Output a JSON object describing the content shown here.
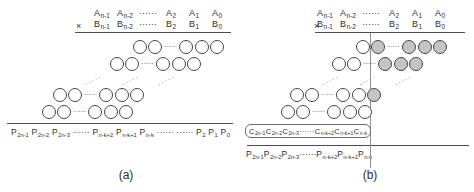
{
  "glyphs": {
    "times": "×",
    "inline_dots": "······",
    "row_dots": "·····",
    "diag_dots": "·····"
  },
  "colors": {
    "ink": "#2e2e2e",
    "circle_stroke": "#474747",
    "circle_fill_white": "#ffffff",
    "circle_fill_gray": "#c5c5c5",
    "rule_line": "#4d4d4d",
    "divider_line": "#8f8f8f"
  },
  "a": {
    "caption": "(a)",
    "operand_a": [
      {
        "t": "sym",
        "b": "A",
        "s": "n-1"
      },
      {
        "t": "sym",
        "b": "A",
        "s": "n-2"
      },
      {
        "t": "dots"
      },
      {
        "t": "sym",
        "b": "A",
        "s": "2"
      },
      {
        "t": "sym",
        "b": "A",
        "s": "1"
      },
      {
        "t": "sym",
        "b": "A",
        "s": "0"
      }
    ],
    "operand_b": [
      {
        "t": "sym",
        "b": "B",
        "s": "n-1"
      },
      {
        "t": "sym",
        "b": "B",
        "s": "n-2"
      },
      {
        "t": "dots"
      },
      {
        "t": "sym",
        "b": "B",
        "s": "2"
      },
      {
        "t": "sym",
        "b": "B",
        "s": "1"
      },
      {
        "t": "sym",
        "b": "B",
        "s": "0"
      }
    ],
    "rows": [
      [
        "white",
        "white",
        "dots",
        "white",
        "white",
        "white"
      ],
      [
        "white",
        "white",
        "dots",
        "white",
        "white",
        "white"
      ],
      [
        "white",
        "white",
        "dots",
        "white",
        "white",
        "white"
      ],
      [
        "white",
        "white",
        "dots",
        "white",
        "white",
        "white"
      ]
    ],
    "product": [
      {
        "t": "sym",
        "b": "P",
        "s": "2n-1"
      },
      {
        "t": "sym",
        "b": "P",
        "s": "2n-2"
      },
      {
        "t": "sym",
        "b": "P",
        "s": "2n-3"
      },
      {
        "t": "dots"
      },
      {
        "t": "sym",
        "b": "P",
        "s": "n-k+2"
      },
      {
        "t": "sym",
        "b": "P",
        "s": "n-k+1"
      },
      {
        "t": "sym",
        "b": "P",
        "s": "n-k"
      },
      {
        "t": "dots"
      },
      {
        "t": "dots"
      },
      {
        "t": "sym",
        "b": "P",
        "s": "2"
      },
      {
        "t": "sym",
        "b": "P",
        "s": "1"
      },
      {
        "t": "sym",
        "b": "P",
        "s": "0"
      }
    ]
  },
  "b": {
    "caption": "(b)",
    "operand_a": [
      {
        "t": "sym",
        "b": "A",
        "s": "n-1"
      },
      {
        "t": "sym",
        "b": "A",
        "s": "n-2"
      },
      {
        "t": "dots"
      },
      {
        "t": "sym",
        "b": "A",
        "s": "2"
      },
      {
        "t": "sym",
        "b": "A",
        "s": "1"
      },
      {
        "t": "sym",
        "b": "A",
        "s": "0"
      }
    ],
    "operand_b": [
      {
        "t": "sym",
        "b": "B",
        "s": "n-1"
      },
      {
        "t": "sym",
        "b": "B",
        "s": "n-2"
      },
      {
        "t": "dots"
      },
      {
        "t": "sym",
        "b": "B",
        "s": "2"
      },
      {
        "t": "sym",
        "b": "B",
        "s": "1"
      },
      {
        "t": "sym",
        "b": "B",
        "s": "0"
      }
    ],
    "rows": [
      [
        "white",
        "gray",
        "dots",
        "gray",
        "gray",
        "gray"
      ],
      [
        "white",
        "white",
        "dots",
        "gray",
        "gray",
        "gray"
      ],
      [
        "white",
        "white",
        "dots",
        "white",
        "white",
        "gray"
      ],
      [
        "white",
        "white",
        "dots",
        "white",
        "white",
        "white"
      ]
    ],
    "correction": [
      {
        "t": "sym",
        "b": "C",
        "s": "2n-1"
      },
      {
        "t": "sym",
        "b": "C",
        "s": "2n-2"
      },
      {
        "t": "sym",
        "b": "C",
        "s": "2n-3"
      },
      {
        "t": "dots"
      },
      {
        "t": "sym",
        "b": "C",
        "s": "n-k+2"
      },
      {
        "t": "sym",
        "b": "C",
        "s": "n-k+1"
      },
      {
        "t": "sym",
        "b": "C",
        "s": "n-k"
      }
    ],
    "product": [
      {
        "t": "sym",
        "b": "P",
        "s": "2n-1"
      },
      {
        "t": "sym",
        "b": "P",
        "s": "2n-2"
      },
      {
        "t": "sym",
        "b": "P",
        "s": "2n-3"
      },
      {
        "t": "dots"
      },
      {
        "t": "sym",
        "b": "P",
        "s": "n-k+2"
      },
      {
        "t": "sym",
        "b": "P",
        "s": "n-k+1"
      },
      {
        "t": "sym",
        "b": "P",
        "s": "n-k"
      }
    ]
  }
}
